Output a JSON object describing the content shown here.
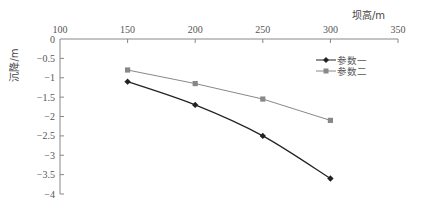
{
  "chart_data": {
    "type": "line",
    "title": "",
    "xlabel": "坝高/m",
    "ylabel": "沉降/m",
    "x": [
      150,
      200,
      250,
      300
    ],
    "series": [
      {
        "name": "参数一",
        "values": [
          -1.1,
          -1.7,
          -2.5,
          -3.6
        ],
        "color": "#222222",
        "marker": "diamond",
        "smooth": true
      },
      {
        "name": "参数二",
        "values": [
          -0.8,
          -1.15,
          -1.55,
          -2.1
        ],
        "color": "#888888",
        "marker": "square",
        "smooth": false
      }
    ],
    "xlim": [
      100,
      350
    ],
    "ylim": [
      -4,
      0
    ],
    "xticks": [
      100,
      150,
      200,
      250,
      300,
      350
    ],
    "yticks": [
      0,
      -0.5,
      -1,
      -1.5,
      -2,
      -2.5,
      -3,
      -3.5,
      -4
    ],
    "xtick_labels": [
      "100",
      "150",
      "200",
      "250",
      "300",
      "350"
    ],
    "ytick_labels": [
      "0",
      "−0.5",
      "−1",
      "−1.5",
      "−2",
      "−2.5",
      "−3",
      "−3.5",
      "−4"
    ],
    "x_axis_position": "top",
    "grid": false,
    "legend_position": "upper right"
  }
}
